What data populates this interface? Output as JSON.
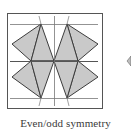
{
  "figure": {
    "caption": "Even/odd symmetry",
    "colors": {
      "background": "#ffffff",
      "frame": "#555555",
      "guide_lines": "#666666",
      "fill": "#c8c8c8",
      "edge": "#3c3c3c",
      "caption_text": "#3a3a3a"
    },
    "frame": {
      "x": 7,
      "y": 13,
      "width": 95,
      "height": 95
    },
    "guide_lines": {
      "horizontal_y": [
        24,
        61,
        98
      ],
      "vertical_x": [
        54
      ]
    },
    "kite_vertices": {
      "top_left": [
        41,
        24
      ],
      "top_right": [
        67,
        24
      ],
      "bottom_left": [
        41,
        98
      ],
      "bottom_right": [
        67,
        98
      ],
      "left_upper": [
        12,
        44
      ],
      "left_lower": [
        12,
        77
      ],
      "right_upper": [
        98,
        44
      ],
      "right_lower": [
        98,
        77
      ],
      "mid_left": [
        31,
        61
      ],
      "center": [
        54,
        61
      ],
      "mid_right": [
        78,
        61
      ]
    },
    "partial_shape_right_edge": true
  }
}
